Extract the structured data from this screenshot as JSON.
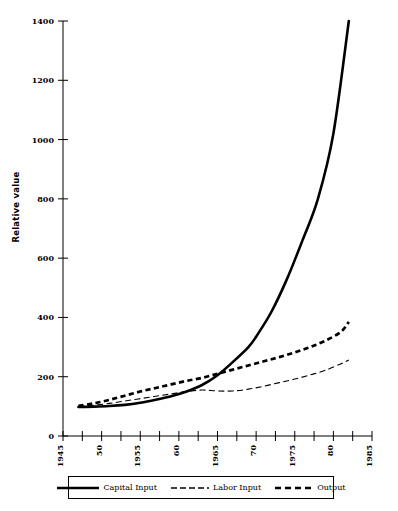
{
  "chart_data": {
    "type": "line",
    "title": "",
    "xlabel": "",
    "ylabel": "Relative value",
    "xlim": [
      1945,
      1985
    ],
    "ylim": [
      0,
      1400
    ],
    "grid": false,
    "legend_position": "bottom",
    "y_ticks": [
      0,
      200,
      400,
      600,
      800,
      1000,
      1200,
      1400
    ],
    "y_tick_labels": [
      "0",
      "200",
      "400",
      "600",
      "800",
      "1000",
      "1200",
      "1400"
    ],
    "x_ticks": [
      1945,
      1947.5,
      1950,
      1952.5,
      1955,
      1957.5,
      1960,
      1962.5,
      1965,
      1967.5,
      1970,
      1972.5,
      1975,
      1977.5,
      1980,
      1982.5,
      1985
    ],
    "x_tick_labels": [
      "1945",
      "",
      "50",
      "",
      "1955",
      "",
      "60",
      "",
      "1965",
      "",
      "70",
      "",
      "1975",
      "",
      "80",
      "",
      "1985"
    ],
    "x_labeled_ticks": [
      {
        "value": 1945,
        "label": "1945"
      },
      {
        "value": 1950,
        "label": "50"
      },
      {
        "value": 1955,
        "label": "1955"
      },
      {
        "value": 1960,
        "label": "60"
      },
      {
        "value": 1965,
        "label": "1965"
      },
      {
        "value": 1970,
        "label": "70"
      },
      {
        "value": 1975,
        "label": "1975"
      },
      {
        "value": 1980,
        "label": "80"
      },
      {
        "value": 1985,
        "label": "1985"
      }
    ],
    "series": [
      {
        "name": "Capital Input",
        "style": "solid-thick",
        "x": [
          1947,
          1949,
          1951,
          1953,
          1955,
          1957,
          1959,
          1961,
          1963,
          1965,
          1967,
          1969,
          1970,
          1972,
          1974,
          1976,
          1978,
          1980,
          1982
        ],
        "values": [
          98,
          99,
          101,
          105,
          112,
          122,
          134,
          150,
          172,
          205,
          250,
          300,
          335,
          420,
          530,
          660,
          800,
          1020,
          1400
        ]
      },
      {
        "name": "Labor Input",
        "style": "dashed-thin",
        "x": [
          1947,
          1949,
          1951,
          1953,
          1955,
          1957,
          1959,
          1961,
          1963,
          1965,
          1967,
          1969,
          1971,
          1973,
          1975,
          1977,
          1979,
          1981,
          1982
        ],
        "values": [
          100,
          104,
          110,
          118,
          126,
          134,
          142,
          150,
          155,
          152,
          152,
          158,
          168,
          180,
          192,
          206,
          222,
          244,
          256
        ]
      },
      {
        "name": "Output",
        "style": "dashed-thick",
        "x": [
          1947,
          1949,
          1951,
          1953,
          1955,
          1957,
          1959,
          1961,
          1963,
          1965,
          1967,
          1969,
          1971,
          1973,
          1975,
          1977,
          1979,
          1981,
          1982
        ],
        "values": [
          102,
          110,
          122,
          136,
          150,
          162,
          174,
          186,
          196,
          210,
          224,
          238,
          252,
          266,
          282,
          300,
          322,
          352,
          385
        ]
      }
    ]
  },
  "legend": {
    "items": [
      {
        "label": "Capital Input",
        "style": "solid-thick"
      },
      {
        "label": "Labor Input",
        "style": "dashed-thin"
      },
      {
        "label": "Output",
        "style": "dashed-thick"
      }
    ]
  },
  "colors": {
    "ink": "#000000",
    "background": "#ffffff"
  }
}
